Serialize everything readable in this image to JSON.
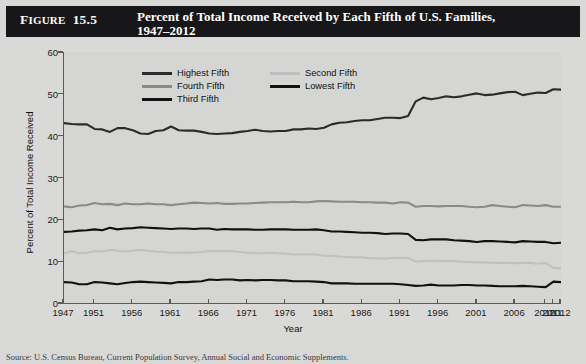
{
  "figure": {
    "number_prefix": "F",
    "number_rest": "IGURE",
    "number_value": "15.5",
    "title": "Percent of Total Income Received by Each Fifth of U.S. Families,\n1947–2012",
    "header_bg": "#17171a",
    "header_fg": "#ffffff"
  },
  "source": {
    "text": "Source: U.S. Census Bureau, Current Population Survey, Annual Social and Economic Supplements."
  },
  "legend": {
    "position": "top-left-inside",
    "items": [
      {
        "label": "Highest Fifth",
        "color": "#2b2b2b",
        "col": 0,
        "row": 0
      },
      {
        "label": "Fourth Fifth",
        "color": "#8a8a8a",
        "col": 0,
        "row": 1
      },
      {
        "label": "Third Fifth",
        "color": "#111111",
        "col": 0,
        "row": 2
      },
      {
        "label": "Second Fifth",
        "color": "#c0c0c0",
        "col": 1,
        "row": 0
      },
      {
        "label": "Lowest Fifth",
        "color": "#111111",
        "col": 1,
        "row": 1
      }
    ]
  },
  "axes": {
    "ylabel": "Percent of Total Income Received",
    "xlabel": "Year",
    "ylim": [
      0,
      60
    ],
    "yticks": [
      0,
      10,
      20,
      30,
      40,
      50,
      60
    ],
    "xlim": [
      1947,
      2012
    ],
    "xticks": [
      1947,
      1951,
      1956,
      1961,
      1966,
      1971,
      1976,
      1981,
      1986,
      1991,
      1996,
      2001,
      2006,
      2010,
      2011,
      2012
    ]
  },
  "chart_data": {
    "type": "line",
    "title": "Percent of Total Income Received by Each Fifth of U.S. Families, 1947–2012",
    "xlabel": "Year",
    "ylabel": "Percent of Total Income Received",
    "xlim": [
      1947,
      2012
    ],
    "ylim": [
      0,
      60
    ],
    "grid": false,
    "legend_position": "upper left",
    "x": [
      1947,
      1948,
      1949,
      1950,
      1951,
      1952,
      1953,
      1954,
      1955,
      1956,
      1957,
      1958,
      1959,
      1960,
      1961,
      1962,
      1963,
      1964,
      1965,
      1966,
      1967,
      1968,
      1969,
      1970,
      1971,
      1972,
      1973,
      1974,
      1975,
      1976,
      1977,
      1978,
      1979,
      1980,
      1981,
      1982,
      1983,
      1984,
      1985,
      1986,
      1987,
      1988,
      1989,
      1990,
      1991,
      1992,
      1993,
      1994,
      1995,
      1996,
      1997,
      1998,
      1999,
      2000,
      2001,
      2002,
      2003,
      2004,
      2005,
      2006,
      2007,
      2008,
      2009,
      2010,
      2011,
      2012
    ],
    "series": [
      {
        "name": "Highest Fifth",
        "color": "#2b2b2b",
        "values": [
          43.0,
          42.8,
          42.7,
          42.7,
          41.6,
          41.5,
          40.9,
          41.8,
          41.8,
          41.3,
          40.5,
          40.4,
          41.1,
          41.3,
          42.2,
          41.3,
          41.2,
          41.2,
          40.9,
          40.5,
          40.4,
          40.5,
          40.6,
          40.9,
          41.1,
          41.4,
          41.1,
          41.0,
          41.1,
          41.1,
          41.5,
          41.5,
          41.7,
          41.6,
          41.9,
          42.7,
          43.1,
          43.2,
          43.5,
          43.7,
          43.7,
          44.0,
          44.3,
          44.3,
          44.2,
          44.7,
          48.2,
          49.1,
          48.7,
          49.0,
          49.4,
          49.2,
          49.4,
          49.8,
          50.1,
          49.7,
          49.8,
          50.1,
          50.4,
          50.5,
          49.7,
          50.0,
          50.3,
          50.2,
          51.1,
          51.0
        ]
      },
      {
        "name": "Fourth Fifth",
        "color": "#8a8a8a",
        "values": [
          23.1,
          22.9,
          23.3,
          23.4,
          23.9,
          23.6,
          23.7,
          23.4,
          23.8,
          23.6,
          23.6,
          23.8,
          23.6,
          23.6,
          23.4,
          23.6,
          23.8,
          24.0,
          23.9,
          23.8,
          23.9,
          23.7,
          23.7,
          23.8,
          23.8,
          23.9,
          24.0,
          24.1,
          24.1,
          24.1,
          24.2,
          24.1,
          24.1,
          24.3,
          24.4,
          24.3,
          24.2,
          24.2,
          24.2,
          24.1,
          24.1,
          24.0,
          24.0,
          23.8,
          24.1,
          24.0,
          23.0,
          23.2,
          23.2,
          23.1,
          23.2,
          23.2,
          23.2,
          23.0,
          22.9,
          23.0,
          23.4,
          23.2,
          23.0,
          22.9,
          23.4,
          23.3,
          23.2,
          23.4,
          23.0,
          23.0
        ]
      },
      {
        "name": "Third Fifth",
        "color": "#111111",
        "values": [
          17.0,
          17.1,
          17.3,
          17.4,
          17.6,
          17.4,
          18.0,
          17.6,
          17.8,
          17.9,
          18.1,
          18.0,
          17.9,
          17.8,
          17.7,
          17.8,
          17.8,
          17.7,
          17.8,
          17.8,
          17.5,
          17.7,
          17.6,
          17.6,
          17.6,
          17.5,
          17.5,
          17.6,
          17.6,
          17.6,
          17.5,
          17.5,
          17.5,
          17.6,
          17.4,
          17.1,
          17.1,
          17.0,
          16.9,
          16.8,
          16.8,
          16.7,
          16.5,
          16.6,
          16.6,
          16.5,
          15.1,
          15.0,
          15.2,
          15.2,
          15.2,
          15.0,
          14.9,
          14.8,
          14.6,
          14.8,
          14.8,
          14.7,
          14.6,
          14.5,
          14.8,
          14.7,
          14.6,
          14.6,
          14.3,
          14.4
        ]
      },
      {
        "name": "Second Fifth",
        "color": "#c0c0c0",
        "values": [
          11.9,
          12.4,
          11.9,
          12.0,
          12.4,
          12.3,
          12.7,
          12.5,
          12.3,
          12.5,
          12.7,
          12.5,
          12.3,
          12.2,
          12.0,
          12.0,
          12.1,
          12.0,
          12.2,
          12.4,
          12.4,
          12.4,
          12.4,
          12.2,
          12.0,
          11.9,
          11.9,
          12.0,
          11.9,
          11.8,
          11.6,
          11.6,
          11.6,
          11.6,
          11.3,
          11.3,
          11.1,
          11.0,
          10.9,
          10.9,
          10.7,
          10.7,
          10.6,
          10.8,
          10.7,
          10.8,
          9.9,
          10.0,
          10.1,
          10.0,
          10.0,
          10.0,
          9.9,
          9.8,
          9.7,
          9.7,
          9.6,
          9.6,
          9.6,
          9.5,
          9.6,
          9.6,
          9.4,
          9.6,
          8.4,
          8.3
        ]
      },
      {
        "name": "Lowest Fifth",
        "color": "#111111",
        "values": [
          5.0,
          4.9,
          4.5,
          4.5,
          5.0,
          4.9,
          4.7,
          4.5,
          4.8,
          5.0,
          5.1,
          5.0,
          4.9,
          4.8,
          4.7,
          5.0,
          5.0,
          5.1,
          5.2,
          5.6,
          5.5,
          5.6,
          5.6,
          5.4,
          5.5,
          5.4,
          5.5,
          5.5,
          5.4,
          5.4,
          5.2,
          5.2,
          5.2,
          5.1,
          5.0,
          4.7,
          4.7,
          4.7,
          4.6,
          4.6,
          4.6,
          4.6,
          4.6,
          4.6,
          4.5,
          4.3,
          4.1,
          4.2,
          4.4,
          4.2,
          4.2,
          4.2,
          4.3,
          4.3,
          4.2,
          4.2,
          4.1,
          4.0,
          4.0,
          4.0,
          4.1,
          4.0,
          3.9,
          3.8,
          5.1,
          5.0
        ]
      }
    ]
  }
}
